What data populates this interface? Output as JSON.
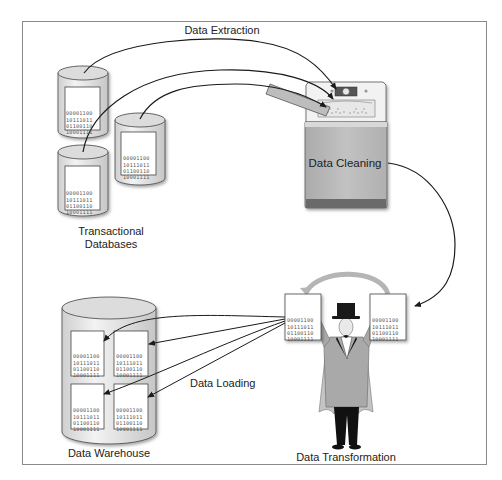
{
  "diagram": {
    "title_labels": {
      "extraction": "Data Extraction",
      "cleaning": "Data Cleaning",
      "transformation": "Data Transformation",
      "loading": "Data Loading",
      "warehouse": "Data Warehouse",
      "sources_line1": "Transactional",
      "sources_line2": "Databases"
    },
    "binary_lines": [
      "00001100",
      "10111011",
      "01100110",
      "10001111"
    ],
    "nodes": [
      {
        "id": "transactional-databases",
        "label": "Transactional Databases",
        "icon": "database-cylinder-icon",
        "count": 3
      },
      {
        "id": "data-cleaning",
        "label": "Data Cleaning",
        "icon": "washing-machine-icon"
      },
      {
        "id": "data-transformation",
        "label": "Data Transformation",
        "icon": "magician-icon"
      },
      {
        "id": "data-warehouse",
        "label": "Data Warehouse",
        "icon": "database-cylinder-icon",
        "documents": 4
      }
    ],
    "edges": [
      {
        "from": "transactional-databases",
        "to": "data-cleaning",
        "label": "Data Extraction"
      },
      {
        "from": "data-cleaning",
        "to": "data-transformation",
        "label": ""
      },
      {
        "from": "data-transformation",
        "to": "data-warehouse",
        "label": "Data Loading"
      }
    ],
    "colors": {
      "frame": "#8a8a8a",
      "line": "#1a1a1a",
      "cylinder_fill": "#e6e6e6",
      "washer_body": "#b9b9b9",
      "coat": "#a9a9a9",
      "cape": "#c4c4c4"
    }
  }
}
